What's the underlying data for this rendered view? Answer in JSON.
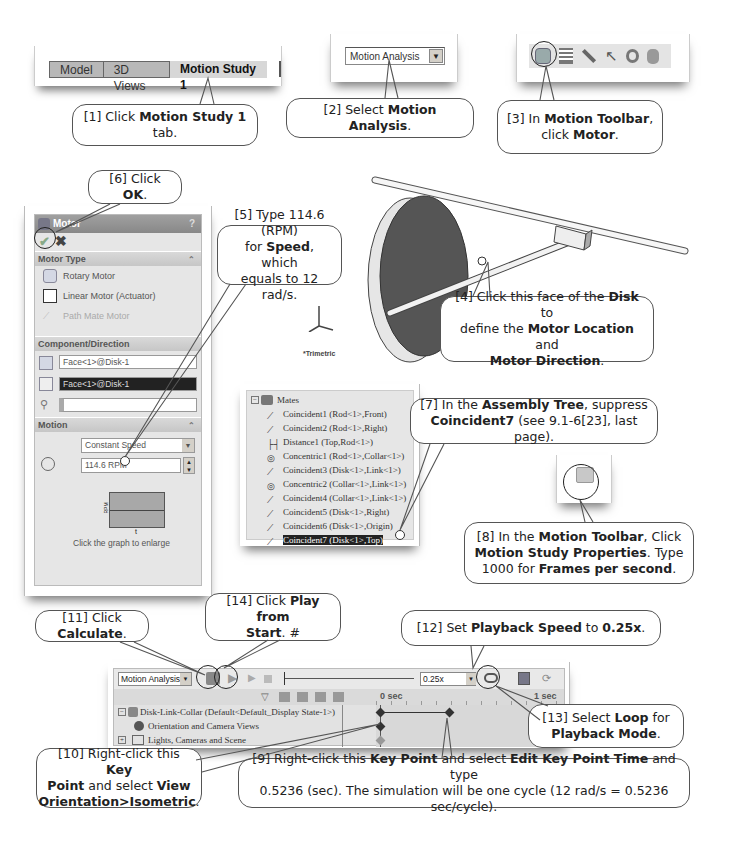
{
  "tabs_shot": {
    "tabs": [
      {
        "label": "Model",
        "active": false
      },
      {
        "label": "3D Views",
        "active": false
      },
      {
        "label": "Motion Study 1",
        "active": true
      }
    ]
  },
  "study_type_shot": {
    "selected": "Motion Analysis"
  },
  "motion_toolbar_shot": {
    "icons": [
      "motor-icon",
      "springs-icon",
      "contact-icon",
      "force-icon",
      "gravity-icon",
      "damper-icon"
    ]
  },
  "motor_panel": {
    "title": "Motor",
    "help": "?",
    "ok_icon": "checkmark-icon",
    "cancel_icon": "x-icon",
    "sections": {
      "motor_type": {
        "label": "Motor Type",
        "options": [
          "Rotary Motor",
          "Linear Motor (Actuator)",
          "Path Mate Motor"
        ]
      },
      "component_direction": {
        "label": "Component/Direction",
        "location_field": "Face<1>@Disk-1",
        "direction_field": "Face<1>@Disk-1",
        "component_field": ""
      },
      "motion": {
        "label": "Motion",
        "type": "Constant Speed",
        "speed": "114.6 RPM",
        "graph_ylabel": "RPM",
        "graph_xlabel": "t",
        "graph_hint": "Click the graph to enlarge"
      }
    }
  },
  "model_view": {
    "orientation_label": "*Trimetric",
    "triad": {
      "x": "X",
      "y": "Y",
      "z": "Z"
    }
  },
  "mates_tree": {
    "root": "Mates",
    "items": [
      {
        "name": "Coincident1",
        "refs": "(Rod<1>,Front)",
        "icon": "coincident-icon"
      },
      {
        "name": "Coincident2",
        "refs": "(Rod<1>,Right)",
        "icon": "coincident-icon"
      },
      {
        "name": "Distance1",
        "refs": "(Top,Rod<1>)",
        "icon": "distance-icon"
      },
      {
        "name": "Concentric1",
        "refs": "(Rod<1>,Collar<1>)",
        "icon": "concentric-icon"
      },
      {
        "name": "Coincident3",
        "refs": "(Disk<1>,Link<1>)",
        "icon": "coincident-icon"
      },
      {
        "name": "Concentric2",
        "refs": "(Collar<1>,Link<1>)",
        "icon": "concentric-icon"
      },
      {
        "name": "Coincident4",
        "refs": "(Collar<1>,Link<1>)",
        "icon": "coincident-icon"
      },
      {
        "name": "Coincident5",
        "refs": "(Disk<1>,Right)",
        "icon": "coincident-icon"
      },
      {
        "name": "Coincident6",
        "refs": "(Disk<1>,Origin)",
        "icon": "coincident-icon"
      },
      {
        "name": "Coincident7",
        "refs": "(Disk<1>,Top)",
        "icon": "coincident-icon",
        "selected": true
      }
    ]
  },
  "motion_manager": {
    "study_type": "Motion Analysis",
    "playback_speed": "0.25x",
    "timeline": {
      "start": "0 sec",
      "end": "1 sec"
    },
    "tree": [
      {
        "label": "Disk-Link-Collar  (Default<Default_Display State-1>)",
        "icon": "assembly-icon"
      },
      {
        "label": "Orientation and Camera Views",
        "icon": "camera-icon"
      },
      {
        "label": "Lights, Cameras and Scene",
        "icon": "lights-icon"
      }
    ]
  },
  "callouts": {
    "c1": {
      "pre": "[1] Click ",
      "bold": "Motion Study 1",
      "post": " tab."
    },
    "c2": {
      "pre": "[2] Select ",
      "bold": "Motion Analysis",
      "post": "."
    },
    "c3": {
      "pre": "[3] In ",
      "bold": "Motion Toolbar",
      "mid": ",",
      "line2_pre": "click ",
      "line2_bold": "Motor",
      "line2_post": "."
    },
    "c4": {
      "pre": "[4] Click this face of the ",
      "bold1": "Disk",
      "mid1": " to",
      "line2_pre": "define the ",
      "bold2": "Motor Location",
      "mid2": " and",
      "bold3": "Motor Direction",
      "post": "."
    },
    "c5": {
      "line1": "[5] Type 114.6 (RPM)",
      "line2_pre": "for ",
      "bold": "Speed",
      "line2_post": ", which",
      "line3": "equals to 12 rad/s."
    },
    "c6": {
      "pre": "[6] Click ",
      "bold": "OK",
      "post": "."
    },
    "c7": {
      "pre": "[7] In the ",
      "bold1": "Assembly Tree",
      "mid": ", suppress",
      "bold2": "Coincident7",
      "post": " (see 9.1-6[23], last page)."
    },
    "c8": {
      "pre": "[8] In the ",
      "bold1": "Motion Toolbar",
      "mid1": ", Click",
      "bold2": "Motion Study Properties",
      "mid2": ". Type",
      "line3_pre": "1000 for ",
      "bold3": "Frames per second",
      "post": "."
    },
    "c9": {
      "pre": "[9] Right-click this ",
      "bold1": "Key Point",
      "mid1": " and select ",
      "bold2": "Edit Key Point Time",
      "mid2": " and type",
      "line2": "0.5236 (sec). The simulation will be one cycle (12 rad/s = 0.5236 sec/cycle)."
    },
    "c10": {
      "pre": "[10] Right-click this ",
      "bold1": "Key",
      "bold1b": "Point",
      "mid": " and select ",
      "bold2": "View",
      "bold3": "Orientation>Isometric",
      "post": "."
    },
    "c11": {
      "pre": "[11] Click ",
      "bold": "Calculate",
      "post": "."
    },
    "c12": {
      "pre": "[12] Set ",
      "bold1": "Playback Speed",
      "mid": " to ",
      "bold2": "0.25x",
      "post": "."
    },
    "c13": {
      "pre": "[13] Select ",
      "bold1": "Loop",
      "mid": " for",
      "bold2": "Playback Mode",
      "post": "."
    },
    "c14": {
      "pre": "[14] Click ",
      "bold1": "Play from",
      "bold2": "Start",
      "post": ". #"
    }
  }
}
